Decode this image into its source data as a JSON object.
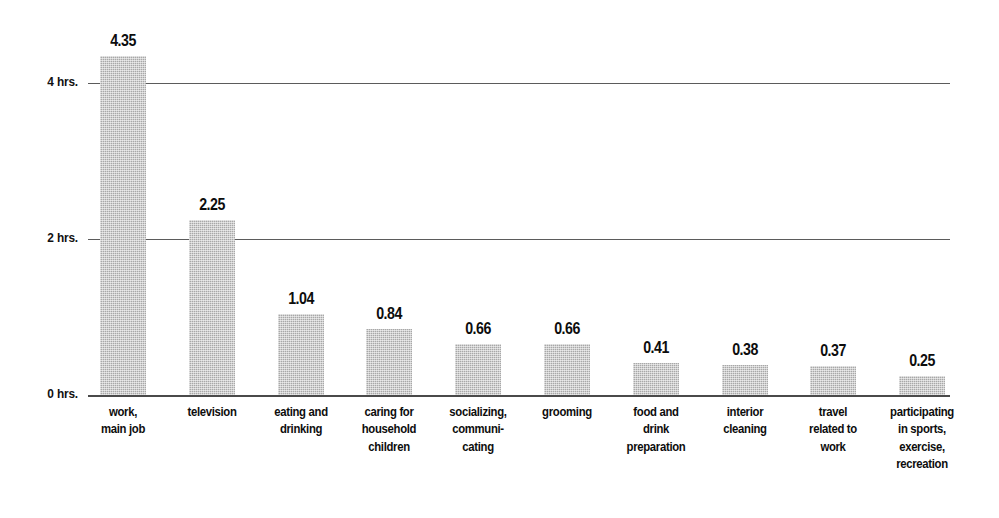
{
  "chart_data": {
    "type": "bar",
    "title": "",
    "subtitle": "",
    "xlabel": "",
    "ylabel": "",
    "ylim": [
      0,
      5
    ],
    "grid": true,
    "legend": false,
    "orientation": "vertical",
    "bar_color": "#a8a8a8",
    "text_color": "#0d0d0d",
    "axis_color": "#5b5b5b",
    "y_ticks": [
      {
        "value": 0,
        "label": "0 hrs."
      },
      {
        "value": 2,
        "label": "2 hrs."
      },
      {
        "value": 4,
        "label": "4 hrs."
      }
    ],
    "categories": [
      "work, main job",
      "television",
      "eating and drinking",
      "caring for household children",
      "socializing, communicating",
      "grooming",
      "food and drink preparation",
      "interior cleaning",
      "travel related to work",
      "participating in sports, exercise, recreation"
    ],
    "category_lines": [
      [
        "work,",
        "main job"
      ],
      [
        "television"
      ],
      [
        "eating and",
        "drinking"
      ],
      [
        "caring for",
        "household",
        "children"
      ],
      [
        "socializing,",
        "communi-",
        "cating"
      ],
      [
        "grooming"
      ],
      [
        "food and",
        "drink",
        "preparation"
      ],
      [
        "interior",
        "cleaning"
      ],
      [
        "travel",
        "related to",
        "work"
      ],
      [
        "participating",
        "in sports,",
        "exercise,",
        "recreation"
      ]
    ],
    "values": [
      4.35,
      2.25,
      1.04,
      0.84,
      0.66,
      0.66,
      0.41,
      0.38,
      0.37,
      0.25
    ],
    "value_labels": [
      "4.35",
      "2.25",
      "1.04",
      "0.84",
      "0.66",
      "0.66",
      "0.41",
      "0.38",
      "0.37",
      "0.25"
    ]
  }
}
